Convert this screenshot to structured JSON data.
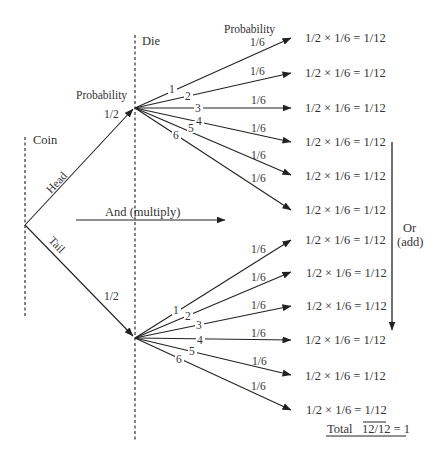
{
  "stages": {
    "coin_label": "Coin",
    "die_label": "Die"
  },
  "probability_headers": {
    "coin_branch": "Probability",
    "die_branch": "Probability"
  },
  "coin_branches": [
    {
      "label": "Head",
      "probability": "1/2"
    },
    {
      "label": "Tail",
      "probability": "1/2"
    }
  ],
  "die_outcomes": [
    "1",
    "2",
    "3",
    "4",
    "5",
    "6"
  ],
  "die_probability": "1/6",
  "equations": {
    "head": [
      "1/2 × 1/6 = 1/12",
      "1/2 × 1/6 = 1/12",
      "1/2 × 1/6 = 1/12",
      "1/2 × 1/6 = 1/12",
      "1/2 × 1/6 = 1/12",
      "1/2 × 1/6 = 1/12"
    ],
    "tail": [
      "1/2 × 1/6 = 1/12",
      "1/2 × 1/6 = 1/12",
      "1/2 × 1/6 = 1/12",
      "1/2 × 1/6 = 1/12",
      "1/2 × 1/6 = 1/12",
      "1/2 × 1/6 = 1/12"
    ]
  },
  "rules": {
    "and_label": "And (multiply)",
    "or_label_line1": "Or",
    "or_label_line2": "(add)"
  },
  "total": {
    "label": "Total",
    "value": "12/12 = 1"
  }
}
